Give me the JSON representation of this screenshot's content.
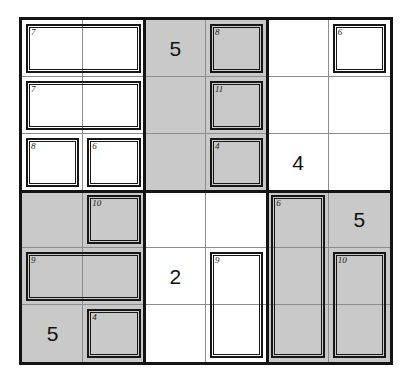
{
  "puzzle": {
    "title": "Killer Sudoku 6x6",
    "grid": {
      "rows": 6,
      "cols": 6,
      "block_rows": 3,
      "block_cols": 2
    },
    "colors": {
      "shaded_cell": "#c9c9c9",
      "empty_cell": "#ffffff",
      "grid_line": "#8d8d8d",
      "border": "#141414",
      "cage_line": "#161616",
      "digit": "#111111"
    },
    "shading": [
      [
        "white",
        "white",
        "gray",
        "gray",
        "white",
        "white"
      ],
      [
        "white",
        "white",
        "gray",
        "gray",
        "white",
        "white"
      ],
      [
        "white",
        "white",
        "gray",
        "gray",
        "white",
        "white"
      ],
      [
        "gray",
        "gray",
        "white",
        "white",
        "gray",
        "gray"
      ],
      [
        "gray",
        "gray",
        "white",
        "white",
        "gray",
        "gray"
      ],
      [
        "gray",
        "gray",
        "white",
        "white",
        "gray",
        "gray"
      ]
    ],
    "values": [
      [
        "",
        "",
        "5",
        "",
        "",
        ""
      ],
      [
        "",
        "",
        "",
        "",
        "",
        ""
      ],
      [
        "",
        "",
        "",
        "",
        "4",
        ""
      ],
      [
        "",
        "",
        "",
        "",
        "",
        "5"
      ],
      [
        "",
        "",
        "2",
        "",
        "",
        ""
      ],
      [
        "5",
        "",
        "",
        "",
        "",
        ""
      ]
    ],
    "cages": [
      {
        "sum": "7",
        "row": 0,
        "col": 0,
        "rowspan": 1,
        "colspan": 2
      },
      {
        "sum": "8",
        "row": 0,
        "col": 3,
        "rowspan": 1,
        "colspan": 1
      },
      {
        "sum": "6",
        "row": 0,
        "col": 5,
        "rowspan": 1,
        "colspan": 1
      },
      {
        "sum": "7",
        "row": 1,
        "col": 0,
        "rowspan": 1,
        "colspan": 2
      },
      {
        "sum": "11",
        "row": 1,
        "col": 3,
        "rowspan": 1,
        "colspan": 1
      },
      {
        "sum": "8",
        "row": 2,
        "col": 0,
        "rowspan": 1,
        "colspan": 1
      },
      {
        "sum": "6",
        "row": 2,
        "col": 1,
        "rowspan": 1,
        "colspan": 1
      },
      {
        "sum": "4",
        "row": 2,
        "col": 3,
        "rowspan": 1,
        "colspan": 1
      },
      {
        "sum": "10",
        "row": 3,
        "col": 1,
        "rowspan": 1,
        "colspan": 1
      },
      {
        "sum": "6",
        "row": 3,
        "col": 4,
        "rowspan": 3,
        "colspan": 1
      },
      {
        "sum": "9",
        "row": 4,
        "col": 0,
        "rowspan": 1,
        "colspan": 2
      },
      {
        "sum": "9",
        "row": 4,
        "col": 3,
        "rowspan": 2,
        "colspan": 1
      },
      {
        "sum": "10",
        "row": 4,
        "col": 5,
        "rowspan": 2,
        "colspan": 1
      },
      {
        "sum": "4",
        "row": 5,
        "col": 1,
        "rowspan": 1,
        "colspan": 1
      }
    ]
  }
}
